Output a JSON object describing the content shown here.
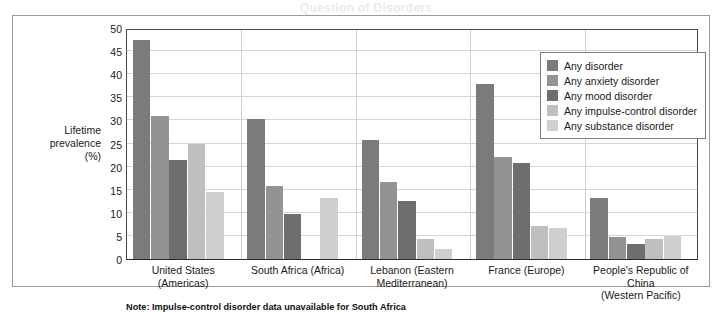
{
  "ghost_text": "Question of Disorders",
  "note": "Note: Impulse-control disorder data unavailable for South Africa",
  "axis": {
    "y_title_line1": "Lifetime",
    "y_title_line2": "prevalence",
    "y_title_line3": "(%)"
  },
  "chart_data": {
    "type": "bar",
    "title": "",
    "xlabel": "",
    "ylabel": "Lifetime prevalence (%)",
    "ylim": [
      0,
      50
    ],
    "ytick_step": 5,
    "yticks": [
      0,
      5,
      10,
      15,
      20,
      25,
      30,
      35,
      40,
      45,
      50
    ],
    "ytick_labels": [
      "0",
      "5",
      "10",
      "15",
      "20",
      "25",
      "30",
      "35",
      "40",
      "45",
      "50"
    ],
    "grid": true,
    "legend_position": "upper right",
    "categories": [
      "United States (Americas)",
      "South Africa (Africa)",
      "Lebanon (Eastern Mediterranean)",
      "France (Europe)",
      "People's Republic of China (Western Pacific)"
    ],
    "category_lines": [
      [
        "United States (Americas)"
      ],
      [
        "South Africa (Africa)"
      ],
      [
        "Lebanon (Eastern",
        "Mediterranean)"
      ],
      [
        "France (Europe)"
      ],
      [
        "People's Republic of China",
        "(Western Pacific)"
      ]
    ],
    "series": [
      {
        "name": "Any disorder",
        "color": "#7b7b7b",
        "values": [
          47.4,
          30.3,
          25.8,
          37.9,
          13.2
        ]
      },
      {
        "name": "Any anxiety disorder",
        "color": "#939393",
        "values": [
          31.0,
          15.8,
          16.7,
          22.0,
          4.8
        ]
      },
      {
        "name": "Any mood disorder",
        "color": "#6e6e6e",
        "values": [
          21.4,
          9.8,
          12.6,
          20.8,
          3.3
        ]
      },
      {
        "name": "Any impulse-control disorder",
        "color": "#bfbfbf",
        "values": [
          25.0,
          null,
          4.4,
          7.2,
          4.3
        ]
      },
      {
        "name": "Any substance disorder",
        "color": "#cfcfcf",
        "values": [
          14.6,
          13.3,
          2.2,
          6.8,
          4.9
        ]
      }
    ]
  },
  "legend": {
    "items": [
      {
        "label": "Any disorder",
        "color": "#7b7b7b"
      },
      {
        "label": "Any anxiety disorder",
        "color": "#939393"
      },
      {
        "label": "Any mood disorder",
        "color": "#6e6e6e"
      },
      {
        "label": "Any impulse-control disorder",
        "color": "#bfbfbf"
      },
      {
        "label": "Any substance disorder",
        "color": "#cfcfcf"
      }
    ]
  }
}
